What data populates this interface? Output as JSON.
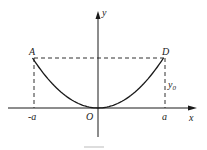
{
  "diagram": {
    "type": "parabola-graph",
    "curve": "y = (y0/a^2) x^2",
    "axes": {
      "x_label": "x",
      "y_label": "y",
      "origin_label": "O"
    },
    "points": {
      "A": {
        "label": "A",
        "coords": "(-a, y0)"
      },
      "D": {
        "label": "D",
        "coords": "(a, y0)"
      }
    },
    "tick_labels": {
      "neg_a": "-a",
      "pos_a": "a"
    },
    "height_label": {
      "main": "y",
      "sub": "0"
    },
    "colors": {
      "ink": "#1a1a1a",
      "background": "#ffffff"
    }
  }
}
